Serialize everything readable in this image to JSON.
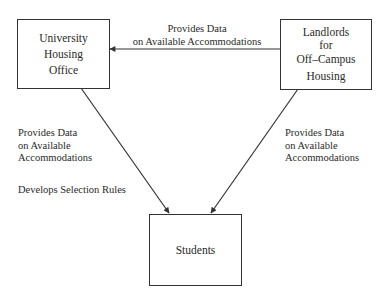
{
  "diagram": {
    "nodes": {
      "housing_office": {
        "lines": [
          "University",
          "Housing",
          "Office"
        ]
      },
      "landlords": {
        "lines": [
          "Landlords",
          "for",
          "Off–Campus",
          "Housing"
        ]
      },
      "students": {
        "lines": [
          "Students"
        ]
      }
    },
    "edges": {
      "landlords_to_office": {
        "lines": [
          "Provides Data",
          "on Available Accommodations"
        ]
      },
      "office_to_students": {
        "lines": [
          "Provides Data",
          "on Available",
          "Accommodations"
        ],
        "extra": "Develops Selection Rules"
      },
      "landlords_to_students": {
        "lines": [
          "Provides Data",
          "on Available",
          "Accommodations"
        ]
      }
    },
    "colors": {
      "line": "#333333",
      "text": "#2a2a2a",
      "background": "#ffffff"
    }
  }
}
